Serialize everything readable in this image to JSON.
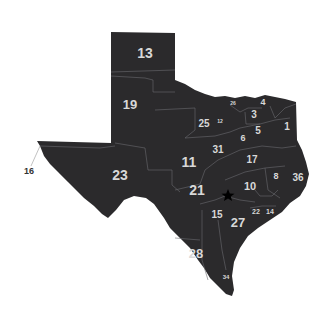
{
  "map": {
    "title": "Texas Congressional Districts",
    "fill_color": "#2b2a2c",
    "border_color": "#6a6a6e",
    "label_color": "#d8d8d8",
    "capital_marker": "star-icon",
    "districts": [
      {
        "id": "13",
        "label": "13",
        "x": 145,
        "y": 54,
        "size": 14
      },
      {
        "id": "19",
        "label": "19",
        "x": 130,
        "y": 106,
        "size": 13
      },
      {
        "id": "25",
        "label": "25",
        "x": 204,
        "y": 124,
        "size": 10
      },
      {
        "id": "12",
        "label": "12",
        "x": 220,
        "y": 122,
        "size": 5
      },
      {
        "id": "26",
        "label": "26",
        "x": 233,
        "y": 104,
        "size": 5
      },
      {
        "id": "4",
        "label": "4",
        "x": 263,
        "y": 103,
        "size": 9
      },
      {
        "id": "3",
        "label": "3",
        "x": 254,
        "y": 115,
        "size": 10
      },
      {
        "id": "5",
        "label": "5",
        "x": 258,
        "y": 131,
        "size": 10
      },
      {
        "id": "1",
        "label": "1",
        "x": 287,
        "y": 127,
        "size": 10
      },
      {
        "id": "6",
        "label": "6",
        "x": 243,
        "y": 139,
        "size": 9
      },
      {
        "id": "31",
        "label": "31",
        "x": 218,
        "y": 150,
        "size": 10
      },
      {
        "id": "17",
        "label": "17",
        "x": 252,
        "y": 160,
        "size": 10
      },
      {
        "id": "11",
        "label": "11",
        "x": 189,
        "y": 163,
        "size": 14
      },
      {
        "id": "23",
        "label": "23",
        "x": 120,
        "y": 176,
        "size": 14
      },
      {
        "id": "8",
        "label": "8",
        "x": 276,
        "y": 177,
        "size": 9
      },
      {
        "id": "36",
        "label": "36",
        "x": 298,
        "y": 178,
        "size": 10
      },
      {
        "id": "10",
        "label": "10",
        "x": 250,
        "y": 187,
        "size": 11
      },
      {
        "id": "21",
        "label": "21",
        "x": 197,
        "y": 191,
        "size": 14
      },
      {
        "id": "22",
        "label": "22",
        "x": 256,
        "y": 212,
        "size": 7
      },
      {
        "id": "14",
        "label": "14",
        "x": 270,
        "y": 212,
        "size": 7
      },
      {
        "id": "15",
        "label": "15",
        "x": 217,
        "y": 215,
        "size": 10
      },
      {
        "id": "27",
        "label": "27",
        "x": 238,
        "y": 224,
        "size": 13
      },
      {
        "id": "28",
        "label": "28",
        "x": 196,
        "y": 255,
        "size": 13
      },
      {
        "id": "34",
        "label": "34",
        "x": 226,
        "y": 277,
        "size": 6
      }
    ],
    "callouts": [
      {
        "id": "16",
        "label": "16",
        "x": 29,
        "y": 174
      }
    ]
  }
}
